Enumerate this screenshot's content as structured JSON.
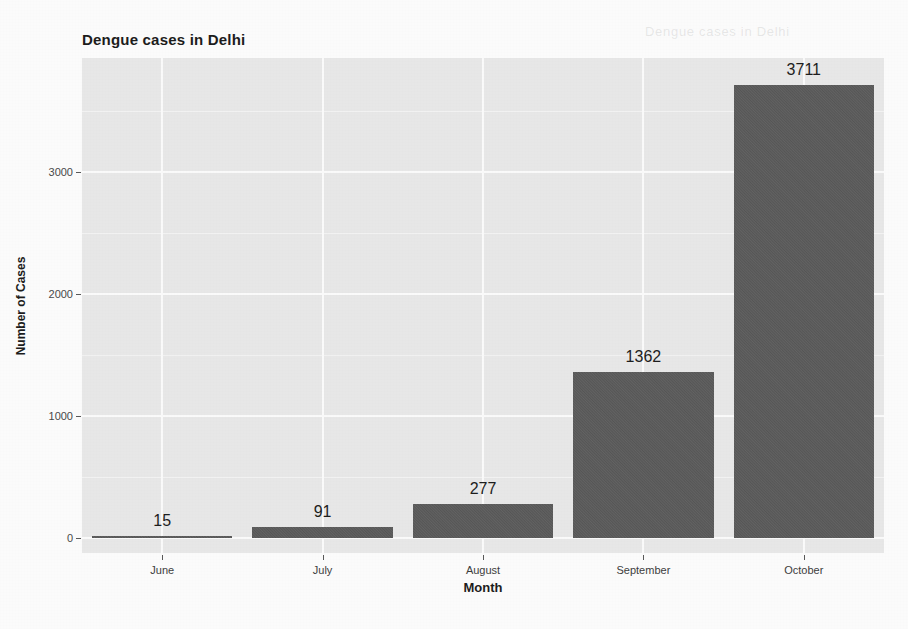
{
  "chart_data": {
    "type": "bar",
    "title": "Dengue cases in Delhi",
    "xlabel": "Month",
    "ylabel": "Number of Cases",
    "categories": [
      "June",
      "July",
      "August",
      "September",
      "October"
    ],
    "values": [
      15,
      91,
      277,
      1362,
      3711
    ],
    "data_labels": [
      "15",
      "91",
      "277",
      "1362",
      "3711"
    ],
    "ylim": [
      0,
      4060
    ],
    "ytick_values": [
      0,
      1000,
      2000,
      3000
    ],
    "ytick_labels": [
      "0",
      "1000",
      "2000",
      "3000"
    ],
    "yminor_values": [
      500,
      1500,
      2500,
      3500
    ],
    "grid": true,
    "legend": "none",
    "bar_color": "#5c5c5c",
    "panel_color": "#e9e9e9",
    "gridline_color": "#fcfcfc",
    "text_color": "#1c1c1c"
  },
  "artifacts": {
    "ghost_text": "Dengue cases in Delhi"
  }
}
